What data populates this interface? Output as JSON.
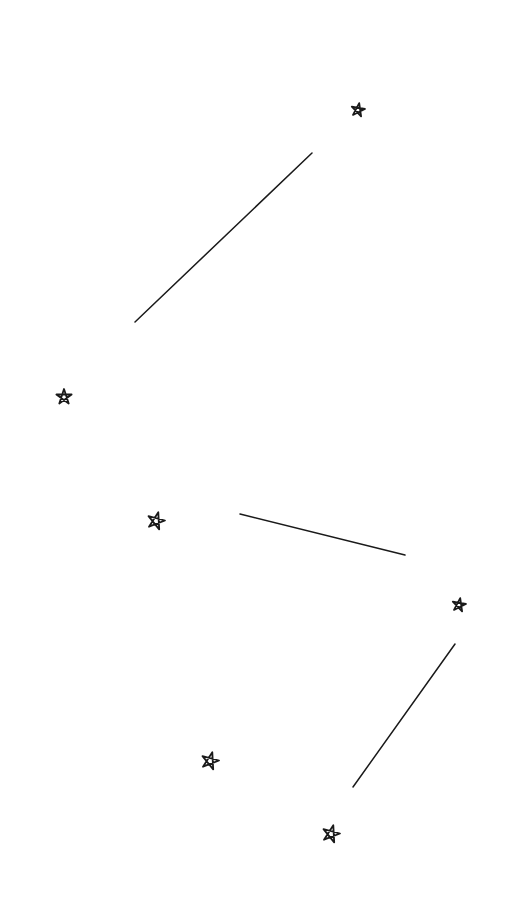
{
  "canvas": {
    "width": 510,
    "height": 918,
    "background": "#ffffff",
    "stroke": "#1a1a1a"
  },
  "stars": [
    {
      "id": "star-1",
      "cx": 358,
      "cy": 110,
      "r": 7,
      "rotation": 10
    },
    {
      "id": "star-2",
      "cx": 64,
      "cy": 397,
      "r": 8,
      "rotation": 0
    },
    {
      "id": "star-3",
      "cx": 156,
      "cy": 521,
      "r": 9,
      "rotation": 15
    },
    {
      "id": "star-4",
      "cx": 459,
      "cy": 605,
      "r": 7,
      "rotation": 10
    },
    {
      "id": "star-5",
      "cx": 210,
      "cy": 761,
      "r": 9,
      "rotation": 15
    },
    {
      "id": "star-6",
      "cx": 331,
      "cy": 834,
      "r": 9,
      "rotation": 15
    }
  ],
  "lines": [
    {
      "id": "line-1",
      "x1": 135,
      "y1": 322,
      "x2": 312,
      "y2": 153
    },
    {
      "id": "line-2",
      "x1": 240,
      "y1": 514,
      "x2": 405,
      "y2": 555
    },
    {
      "id": "line-3",
      "x1": 353,
      "y1": 787,
      "x2": 455,
      "y2": 644
    }
  ]
}
